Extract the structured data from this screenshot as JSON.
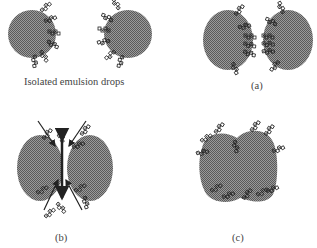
{
  "panels": {
    "isolated": {
      "caption": "Isolated emulsion drops"
    },
    "a": {
      "caption": "(a)"
    },
    "b": {
      "caption": "(b)"
    },
    "c": {
      "caption": "(c)"
    }
  },
  "colors": {
    "drop": "#8a8a8a",
    "drop_dark": "#5e5e5e",
    "surfactant": "#222222",
    "arrow": "#222222",
    "text": "#444444"
  }
}
